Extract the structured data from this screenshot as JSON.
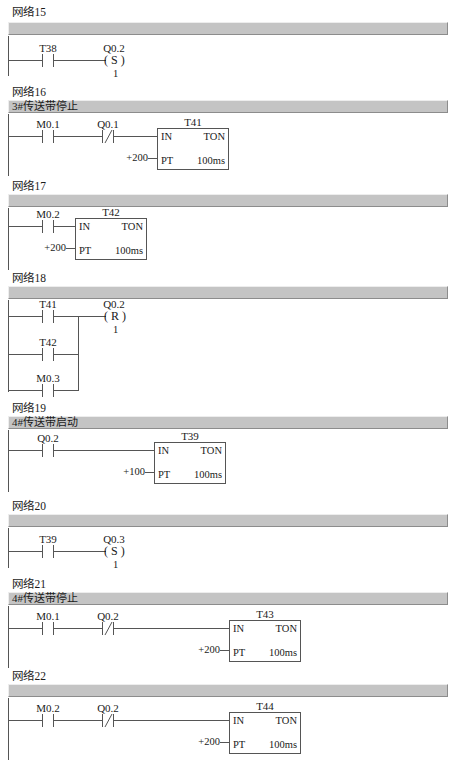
{
  "document": {
    "type": "ladder-logic-diagram",
    "language": "LAD",
    "networks": [
      {
        "id": "net15",
        "label": "网络15",
        "title": "",
        "elements": {
          "contacts": [
            {
              "name": "T38",
              "kind": "NO"
            }
          ],
          "coil": {
            "name": "Q0.2",
            "op": "S",
            "count": "1"
          }
        }
      },
      {
        "id": "net16",
        "label": "网络16",
        "title": "3#传送带停止",
        "elements": {
          "contacts": [
            {
              "name": "M0.1",
              "kind": "NO"
            },
            {
              "name": "Q0.1",
              "kind": "NC"
            }
          ],
          "timer": {
            "name": "T41",
            "in": "IN",
            "type": "TON",
            "pt": "PT",
            "preset": "+200",
            "resolution": "100ms"
          }
        }
      },
      {
        "id": "net17",
        "label": "网络17",
        "title": "",
        "elements": {
          "contacts": [
            {
              "name": "M0.2",
              "kind": "NO"
            }
          ],
          "timer": {
            "name": "T42",
            "in": "IN",
            "type": "TON",
            "pt": "PT",
            "preset": "+200",
            "resolution": "100ms"
          }
        }
      },
      {
        "id": "net18",
        "label": "网络18",
        "title": "",
        "elements": {
          "branches": [
            {
              "name": "T41",
              "kind": "NO"
            },
            {
              "name": "T42",
              "kind": "NO"
            },
            {
              "name": "M0.3",
              "kind": "NO"
            }
          ],
          "coil": {
            "name": "Q0.2",
            "op": "R",
            "count": "1"
          }
        }
      },
      {
        "id": "net19",
        "label": "网络19",
        "title": "4#传送带启动",
        "elements": {
          "contacts": [
            {
              "name": "Q0.2",
              "kind": "NO"
            }
          ],
          "timer": {
            "name": "T39",
            "in": "IN",
            "type": "TON",
            "pt": "PT",
            "preset": "+100",
            "resolution": "100ms"
          }
        }
      },
      {
        "id": "net20",
        "label": "网络20",
        "title": "",
        "elements": {
          "contacts": [
            {
              "name": "T39",
              "kind": "NO"
            }
          ],
          "coil": {
            "name": "Q0.3",
            "op": "S",
            "count": "1"
          }
        }
      },
      {
        "id": "net21",
        "label": "网络21",
        "title": "4#传送带停止",
        "elements": {
          "contacts": [
            {
              "name": "M0.1",
              "kind": "NO"
            },
            {
              "name": "Q0.2",
              "kind": "NC"
            }
          ],
          "timer": {
            "name": "T43",
            "in": "IN",
            "type": "TON",
            "pt": "PT",
            "preset": "+200",
            "resolution": "100ms"
          }
        }
      },
      {
        "id": "net22",
        "label": "网络22",
        "title": "",
        "elements": {
          "contacts": [
            {
              "name": "M0.2",
              "kind": "NO"
            },
            {
              "name": "Q0.2",
              "kind": "NC"
            }
          ],
          "timer": {
            "name": "T44",
            "in": "IN",
            "type": "TON",
            "pt": "PT",
            "preset": "+200",
            "resolution": "100ms"
          }
        }
      }
    ]
  },
  "colors": {
    "bar": "#c4c4c4",
    "line": "#555555",
    "text": "#1a1a1a",
    "background": "#ffffff"
  }
}
